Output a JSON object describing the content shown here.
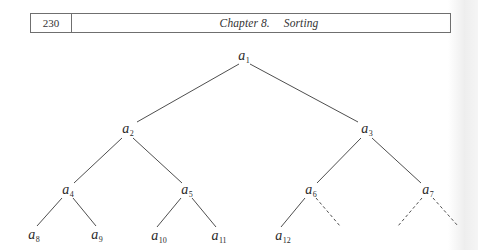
{
  "header": {
    "page_number": "230",
    "chapter_label": "Chapter 8.",
    "chapter_name": "Sorting"
  },
  "tree": {
    "description": "Complete binary tree (heap) with 12 nodes a1..a12; missing children of a6 and a7 shown as dashed edges",
    "nodes": [
      {
        "id": "a1",
        "base": "a",
        "sub": "1",
        "x": 244,
        "y": 57
      },
      {
        "id": "a2",
        "base": "a",
        "sub": "2",
        "x": 128,
        "y": 130
      },
      {
        "id": "a3",
        "base": "a",
        "sub": "3",
        "x": 367,
        "y": 130
      },
      {
        "id": "a4",
        "base": "a",
        "sub": "4",
        "x": 68,
        "y": 191
      },
      {
        "id": "a5",
        "base": "a",
        "sub": "5",
        "x": 187,
        "y": 191
      },
      {
        "id": "a6",
        "base": "a",
        "sub": "6",
        "x": 311,
        "y": 191
      },
      {
        "id": "a7",
        "base": "a",
        "sub": "7",
        "x": 428,
        "y": 191
      },
      {
        "id": "a8",
        "base": "a",
        "sub": "8",
        "x": 34,
        "y": 236
      },
      {
        "id": "a9",
        "base": "a",
        "sub": "9",
        "x": 97,
        "y": 236
      },
      {
        "id": "a10",
        "base": "a",
        "sub": "10",
        "x": 159,
        "y": 237
      },
      {
        "id": "a11",
        "base": "a",
        "sub": "11",
        "x": 219,
        "y": 237
      },
      {
        "id": "a12",
        "base": "a",
        "sub": "12",
        "x": 283,
        "y": 237
      }
    ],
    "edges": [
      {
        "from": "a1",
        "to": "a2",
        "x1": 239,
        "y1": 64,
        "x2": 137,
        "y2": 122,
        "style": "solid"
      },
      {
        "from": "a1",
        "to": "a3",
        "x1": 250,
        "y1": 64,
        "x2": 358,
        "y2": 122,
        "style": "solid"
      },
      {
        "from": "a2",
        "to": "a4",
        "x1": 122,
        "y1": 138,
        "x2": 74,
        "y2": 183,
        "style": "solid"
      },
      {
        "from": "a2",
        "to": "a5",
        "x1": 133,
        "y1": 138,
        "x2": 182,
        "y2": 183,
        "style": "solid"
      },
      {
        "from": "a3",
        "to": "a6",
        "x1": 361,
        "y1": 138,
        "x2": 317,
        "y2": 183,
        "style": "solid"
      },
      {
        "from": "a3",
        "to": "a7",
        "x1": 372,
        "y1": 138,
        "x2": 421,
        "y2": 183,
        "style": "solid"
      },
      {
        "from": "a4",
        "to": "a8",
        "x1": 62,
        "y1": 198,
        "x2": 37,
        "y2": 226,
        "style": "solid"
      },
      {
        "from": "a4",
        "to": "a9",
        "x1": 73,
        "y1": 198,
        "x2": 96,
        "y2": 226,
        "style": "solid"
      },
      {
        "from": "a5",
        "to": "a10",
        "x1": 181,
        "y1": 198,
        "x2": 157,
        "y2": 227,
        "style": "solid"
      },
      {
        "from": "a5",
        "to": "a11",
        "x1": 192,
        "y1": 198,
        "x2": 216,
        "y2": 227,
        "style": "solid"
      },
      {
        "from": "a6",
        "to": "a12",
        "x1": 305,
        "y1": 198,
        "x2": 281,
        "y2": 227,
        "style": "solid"
      },
      {
        "from": "a6",
        "to": "empty",
        "x1": 316,
        "y1": 198,
        "x2": 340,
        "y2": 226,
        "style": "dashed"
      },
      {
        "from": "a7",
        "to": "empty",
        "x1": 422,
        "y1": 198,
        "x2": 398,
        "y2": 226,
        "style": "dashed"
      },
      {
        "from": "a7",
        "to": "empty",
        "x1": 433,
        "y1": 198,
        "x2": 458,
        "y2": 226,
        "style": "dashed"
      }
    ]
  },
  "colors": {
    "ink": "#2a2a2a",
    "rule": "#6f6f6f",
    "background": "#ffffff"
  }
}
